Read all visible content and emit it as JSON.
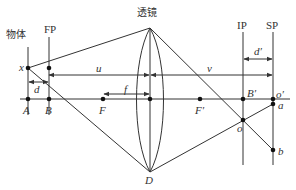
{
  "diagram": {
    "title_lens": "透镜",
    "labels": {
      "object": "物体",
      "fp": "FP",
      "ip": "IP",
      "sp": "SP",
      "x": "x",
      "d": "d",
      "u": "u",
      "v": "v",
      "f": "f",
      "d_prime": "d′",
      "A": "A",
      "B": "B",
      "F": "F",
      "F_prime": "F′",
      "D": "D",
      "B_prime": "B′",
      "o_prime": "o′",
      "a": "a",
      "o": "o",
      "b": "b"
    },
    "colors": {
      "line": "#333333",
      "point": "#111111"
    }
  }
}
